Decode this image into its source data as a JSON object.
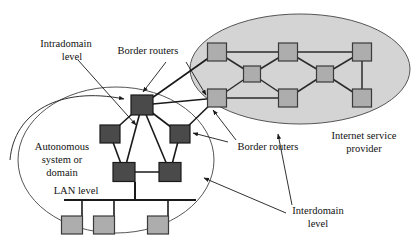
{
  "figure": {
    "background_color": "#ffffff"
  },
  "colors": {
    "border_router": "#4a4a4a",
    "isp_node": "#adadad",
    "lan_host": "#adadad",
    "isp_cloud_fill": "#d4d4d4",
    "as_cloud_fill": "#ffffff",
    "outline": "#1a1a1a",
    "thin_outline": "#555555",
    "label_text": "#111111"
  },
  "labels": {
    "intradomain_level": "Intradomain\nlevel",
    "intradomain_level_line1": "Intradomain",
    "intradomain_level_line2": "level",
    "border_routers_top": "Border routers",
    "border_routers_bottom": "Border routers",
    "autonomous_system_line1": "Autonomous",
    "autonomous_system_line2": "system or",
    "autonomous_system_line3": "domain",
    "lan_level": "LAN level",
    "interdomain_level_line1": "Interdomain",
    "interdomain_level_line2": "level",
    "isp_line1": "Internet service",
    "isp_line2": "provider"
  },
  "regions": {
    "autonomous_system": {
      "name": "Autonomous system or domain",
      "shape": "ellipse",
      "cx": 116,
      "cy": 160,
      "rx": 98,
      "ry": 73,
      "fill": "#ffffff"
    },
    "internet_service_provider": {
      "name": "Internet service provider",
      "shape": "ellipse",
      "cx": 300,
      "cy": 69,
      "rx": 110,
      "ry": 55,
      "fill": "#d4d4d4"
    }
  },
  "nodes": {
    "border_routers": [
      {
        "id": "br-top",
        "label": "Border router",
        "x": 142,
        "y": 105,
        "w": 22,
        "h": 20
      },
      {
        "id": "br-left",
        "label": "Border router",
        "x": 110,
        "y": 134,
        "w": 20,
        "h": 18
      },
      {
        "id": "br-right",
        "label": "Border router",
        "x": 180,
        "y": 134,
        "w": 20,
        "h": 18
      },
      {
        "id": "rt-lower-left",
        "label": "Router",
        "x": 124,
        "y": 172,
        "w": 22,
        "h": 19
      },
      {
        "id": "rt-lower-right",
        "label": "Router",
        "x": 170,
        "y": 172,
        "w": 22,
        "h": 19
      }
    ],
    "isp_nodes": [
      {
        "id": "isp-t1",
        "x": 217,
        "y": 52,
        "w": 19,
        "h": 18
      },
      {
        "id": "isp-t2",
        "x": 288,
        "y": 52,
        "w": 19,
        "h": 18
      },
      {
        "id": "isp-t3",
        "x": 362,
        "y": 52,
        "w": 19,
        "h": 18
      },
      {
        "id": "isp-m1",
        "x": 252,
        "y": 74,
        "w": 17,
        "h": 16
      },
      {
        "id": "isp-m2",
        "x": 325,
        "y": 74,
        "w": 17,
        "h": 16
      },
      {
        "id": "isp-b1",
        "x": 217,
        "y": 98,
        "w": 19,
        "h": 18
      },
      {
        "id": "isp-b2",
        "x": 288,
        "y": 98,
        "w": 19,
        "h": 18
      },
      {
        "id": "isp-b3",
        "x": 362,
        "y": 98,
        "w": 19,
        "h": 18
      }
    ],
    "lan_hosts": [
      {
        "id": "host-1",
        "x": 72,
        "y": 216,
        "w": 21,
        "h": 18
      },
      {
        "id": "host-2",
        "x": 104,
        "y": 216,
        "w": 21,
        "h": 18
      },
      {
        "id": "host-3",
        "x": 158,
        "y": 216,
        "w": 21,
        "h": 18
      }
    ]
  },
  "links": {
    "intradomain": [
      {
        "from": "br-top",
        "to": "br-left"
      },
      {
        "from": "br-top",
        "to": "br-right"
      },
      {
        "from": "br-top",
        "to": "rt-lower-left"
      },
      {
        "from": "br-top",
        "to": "rt-lower-right"
      },
      {
        "from": "br-left",
        "to": "rt-lower-left"
      },
      {
        "from": "br-right",
        "to": "rt-lower-right"
      },
      {
        "from": "rt-lower-left",
        "to": "rt-lower-right"
      }
    ],
    "interdomain": [
      {
        "from": "br-top",
        "to": "isp-t1"
      },
      {
        "from": "br-top",
        "to": "isp-b1"
      },
      {
        "from": "br-right",
        "to": "isp-b1"
      }
    ],
    "isp_mesh": [
      {
        "from": "isp-t1",
        "to": "isp-t2"
      },
      {
        "from": "isp-t2",
        "to": "isp-t3"
      },
      {
        "from": "isp-b1",
        "to": "isp-b2"
      },
      {
        "from": "isp-t1",
        "to": "isp-m1"
      },
      {
        "from": "isp-m1",
        "to": "isp-t2"
      },
      {
        "from": "isp-b1",
        "to": "isp-m1"
      },
      {
        "from": "isp-m1",
        "to": "isp-b2"
      },
      {
        "from": "isp-t2",
        "to": "isp-m2"
      },
      {
        "from": "isp-m2",
        "to": "isp-t3"
      },
      {
        "from": "isp-b2",
        "to": "isp-m2"
      },
      {
        "from": "isp-m2",
        "to": "isp-b3"
      },
      {
        "from": "isp-t3",
        "to": "isp-b3"
      }
    ],
    "lan_bus": {
      "y": 200,
      "x1": 64,
      "x2": 196,
      "drops": [
        {
          "from": "rt-lower-left",
          "x": 135
        },
        {
          "host": "host-1",
          "x": 82
        },
        {
          "host": "host-2",
          "x": 114
        },
        {
          "host": "host-3",
          "x": 168
        }
      ]
    }
  },
  "annotations": [
    {
      "id": "intradomain-leader",
      "label": "Intradomain level leader",
      "text_x": 66,
      "text_y": 45
    },
    {
      "id": "border-routers-top-leader",
      "label": "Border routers leader (top)",
      "text_x": 148,
      "text_y": 57
    },
    {
      "id": "border-routers-bottom-leader",
      "label": "Border routers leader (bottom)",
      "text_x": 262,
      "text_y": 148
    },
    {
      "id": "interdomain-leader",
      "label": "Interdomain level leader",
      "text_x": 312,
      "text_y": 218
    },
    {
      "id": "isp-label",
      "label": "Internet service provider label",
      "text_x": 368,
      "text_y": 140
    }
  ]
}
